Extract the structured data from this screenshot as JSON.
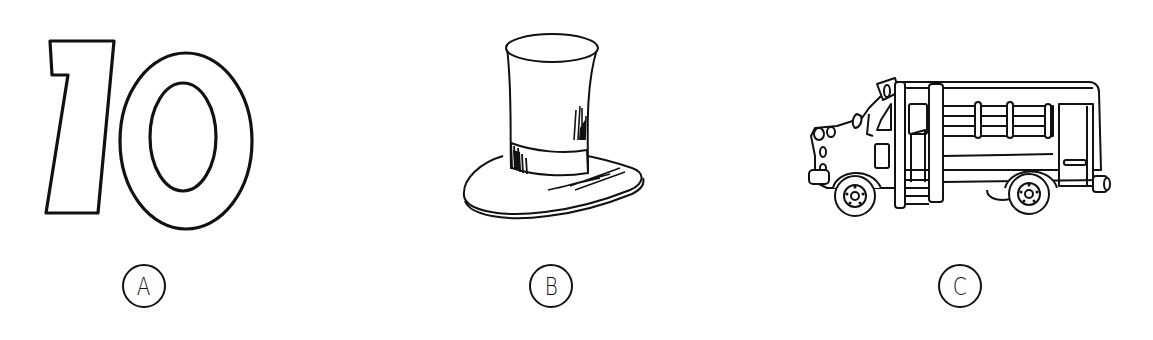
{
  "options": [
    {
      "letter": "A",
      "picture": "number-ten",
      "description": "Outlined numeral 10"
    },
    {
      "letter": "B",
      "picture": "top-hat",
      "description": "Top hat"
    },
    {
      "letter": "C",
      "picture": "school-bus",
      "description": "Small school bus"
    }
  ],
  "colors": {
    "line": "#111111",
    "background": "#ffffff"
  }
}
